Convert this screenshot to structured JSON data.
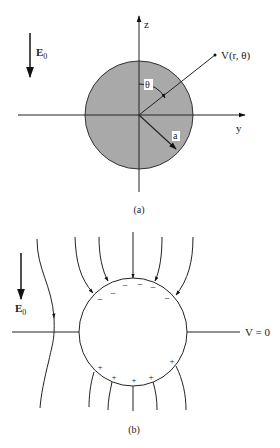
{
  "figure_a": {
    "caption": "(a)",
    "field_label": "E",
    "field_subscript": "0",
    "z_axis_label": "z",
    "y_axis_label": "y",
    "point_label": "V(r, θ)",
    "angle_label": "θ",
    "radius_label": "a",
    "sphere_fill": "#a9a9a9"
  },
  "figure_b": {
    "caption": "(b)",
    "field_label": "E",
    "field_subscript": "0",
    "equipotential_label": "V = 0",
    "negative_charges": [
      "−",
      "−",
      "−",
      "−",
      "−",
      "−",
      "−"
    ],
    "positive_charges": [
      "+",
      "+",
      "+",
      "+",
      "+",
      "+"
    ]
  }
}
